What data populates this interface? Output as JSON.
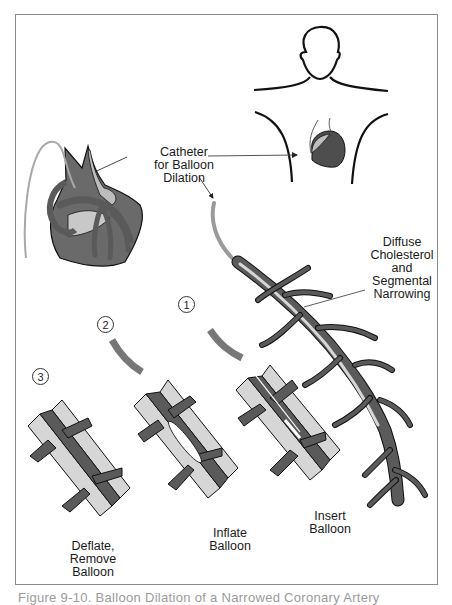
{
  "figure": {
    "caption": "Figure 9-10. Balloon Dilation of a Narrowed Coronary Artery",
    "colors": {
      "vessel_dark": "#5a5a5a",
      "vessel_light": "#d6d6d6",
      "catheter": "#9a9a9a",
      "outline": "#1a1a1a",
      "frame": "#8a8a8a"
    }
  },
  "labels": {
    "catheter": "Catheter\nfor Balloon\nDilation",
    "narrowing": "Diffuse\nCholesterol\nand\nSegmental\nNarrowing",
    "step1": "Insert\nBalloon",
    "step2": "Inflate\nBalloon",
    "step3": "Deflate,\nRemove\nBalloon"
  },
  "steps": [
    {
      "number": "1",
      "label": "Insert Balloon"
    },
    {
      "number": "2",
      "label": "Inflate Balloon"
    },
    {
      "number": "3",
      "label": "Deflate, Remove Balloon"
    }
  ],
  "step_markers": {
    "one": "1",
    "two": "2",
    "three": "3"
  }
}
